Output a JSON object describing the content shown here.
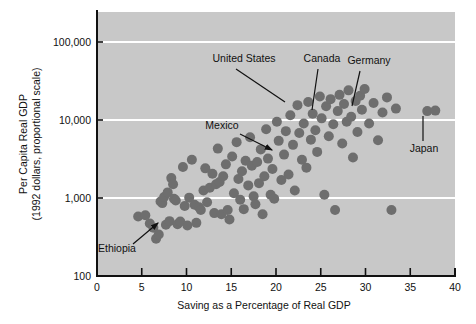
{
  "chart_data": {
    "type": "scatter",
    "title": "",
    "xlabel": "Saving as a Percentage of Real GDP",
    "ylabel_line1": "Per Capita Real GDP",
    "ylabel_line2": "(1992 dollars, proportional scale)",
    "yscale": "log",
    "xlim": [
      0,
      40
    ],
    "ylim": [
      100,
      200000
    ],
    "xticks": [
      0,
      5,
      10,
      15,
      20,
      25,
      30,
      35,
      40
    ],
    "xtick_labels": [
      "0",
      "5",
      "10",
      "15",
      "20",
      "25",
      "30",
      "35",
      "40"
    ],
    "yticks": [
      100,
      1000,
      10000,
      100000
    ],
    "ytick_labels": [
      "100",
      "1,000",
      "10,000",
      "100,000"
    ],
    "gridlines": [
      "100,000",
      "10,000",
      "1,000"
    ],
    "grid": true,
    "grid_color": "#ffffff",
    "plot_bg_color": "#c8c8c8",
    "point_color": "#6e6e6e",
    "marker_size": 5,
    "legend": "none",
    "points": [
      [
        4.6,
        580
      ],
      [
        5.4,
        600
      ],
      [
        5.9,
        470
      ],
      [
        6.3,
        415
      ],
      [
        6.6,
        300
      ],
      [
        6.9,
        340
      ],
      [
        7.1,
        900
      ],
      [
        7.3,
        860
      ],
      [
        7.5,
        1030
      ],
      [
        7.7,
        455
      ],
      [
        7.9,
        1180
      ],
      [
        8.1,
        505
      ],
      [
        8.3,
        1800
      ],
      [
        8.5,
        1500
      ],
      [
        8.6,
        980
      ],
      [
        8.8,
        930
      ],
      [
        9.0,
        460
      ],
      [
        9.3,
        500
      ],
      [
        9.6,
        2500
      ],
      [
        9.8,
        790
      ],
      [
        10.1,
        445
      ],
      [
        10.3,
        1010
      ],
      [
        10.6,
        3100
      ],
      [
        10.9,
        820
      ],
      [
        11.1,
        480
      ],
      [
        11.4,
        760
      ],
      [
        11.6,
        700
      ],
      [
        11.9,
        1250
      ],
      [
        12.1,
        2400
      ],
      [
        12.3,
        880
      ],
      [
        12.6,
        1350
      ],
      [
        12.9,
        2050
      ],
      [
        13.1,
        640
      ],
      [
        13.3,
        1500
      ],
      [
        13.5,
        4300
      ],
      [
        13.7,
        1600
      ],
      [
        13.9,
        620
      ],
      [
        14.1,
        1900
      ],
      [
        14.4,
        2700
      ],
      [
        14.6,
        700
      ],
      [
        14.8,
        530
      ],
      [
        15.1,
        3400
      ],
      [
        15.3,
        1150
      ],
      [
        15.6,
        5200
      ],
      [
        15.8,
        1750
      ],
      [
        16.0,
        950
      ],
      [
        16.2,
        2200
      ],
      [
        16.4,
        720
      ],
      [
        16.6,
        3000
      ],
      [
        16.9,
        1450
      ],
      [
        17.1,
        6000
      ],
      [
        17.3,
        2600
      ],
      [
        17.5,
        1050
      ],
      [
        17.7,
        830
      ],
      [
        17.9,
        2900
      ],
      [
        18.1,
        1550
      ],
      [
        18.3,
        4200
      ],
      [
        18.5,
        620
      ],
      [
        18.7,
        1900
      ],
      [
        18.9,
        7600
      ],
      [
        19.1,
        3200
      ],
      [
        19.4,
        1100
      ],
      [
        19.6,
        2350
      ],
      [
        19.8,
        980
      ],
      [
        20.1,
        9500
      ],
      [
        20.3,
        5400
      ],
      [
        20.6,
        1700
      ],
      [
        20.9,
        3600
      ],
      [
        21.1,
        7200
      ],
      [
        21.4,
        2000
      ],
      [
        21.6,
        11500
      ],
      [
        21.9,
        4800
      ],
      [
        22.1,
        1250
      ],
      [
        22.4,
        15500
      ],
      [
        22.6,
        6800
      ],
      [
        22.9,
        3100
      ],
      [
        23.1,
        9000
      ],
      [
        23.4,
        2450
      ],
      [
        23.6,
        17000
      ],
      [
        23.9,
        5600
      ],
      [
        24.1,
        12000
      ],
      [
        24.4,
        7400
      ],
      [
        24.6,
        3900
      ],
      [
        24.9,
        20000
      ],
      [
        25.1,
        10500
      ],
      [
        25.4,
        1100
      ],
      [
        25.6,
        15000
      ],
      [
        25.9,
        6200
      ],
      [
        26.1,
        18500
      ],
      [
        26.4,
        8800
      ],
      [
        26.6,
        700
      ],
      [
        26.9,
        13000
      ],
      [
        27.1,
        21000
      ],
      [
        27.4,
        5000
      ],
      [
        27.6,
        16000
      ],
      [
        27.9,
        9500
      ],
      [
        28.1,
        24000
      ],
      [
        28.4,
        11000
      ],
      [
        28.6,
        3300
      ],
      [
        28.9,
        17500
      ],
      [
        29.1,
        7000
      ],
      [
        29.4,
        20500
      ],
      [
        29.6,
        13500
      ],
      [
        29.9,
        25000
      ],
      [
        30.4,
        9000
      ],
      [
        30.9,
        16500
      ],
      [
        31.4,
        5500
      ],
      [
        31.9,
        12500
      ],
      [
        32.4,
        19500
      ],
      [
        32.9,
        700
      ],
      [
        33.4,
        14000
      ],
      [
        36.9,
        13000
      ],
      [
        37.8,
        13200
      ]
    ],
    "annotations": [
      {
        "name": "United States",
        "label_x": 244,
        "label_y": 62,
        "tip_x": 285,
        "tip_y": 102,
        "anchor": "middle",
        "line_from_x": 236,
        "line_from_y": 69,
        "arrow": false
      },
      {
        "name": "Canada",
        "label_x": 322,
        "label_y": 62,
        "tip_x": 312,
        "tip_y": 110,
        "anchor": "middle",
        "line_from_x": 318,
        "line_from_y": 69,
        "arrow": false
      },
      {
        "name": "Germany",
        "label_x": 369,
        "label_y": 64,
        "tip_x": 352,
        "tip_y": 106,
        "anchor": "middle",
        "line_from_x": 360,
        "line_from_y": 71,
        "arrow": false
      },
      {
        "name": "Mexico",
        "label_x": 222,
        "label_y": 129,
        "tip_x": 272,
        "tip_y": 150,
        "anchor": "middle",
        "line_from_x": 240,
        "line_from_y": 134,
        "arrow": true
      },
      {
        "name": "Japan",
        "label_x": 424,
        "label_y": 152,
        "tip_x": 423,
        "tip_y": 116,
        "anchor": "middle",
        "line_from_x": 423,
        "line_from_y": 141,
        "arrow": false
      },
      {
        "name": "Ethiopia",
        "label_x": 117,
        "label_y": 252,
        "tip_x": 158,
        "tip_y": 223,
        "anchor": "middle",
        "line_from_x": 133,
        "line_from_y": 244,
        "arrow": true
      }
    ]
  }
}
